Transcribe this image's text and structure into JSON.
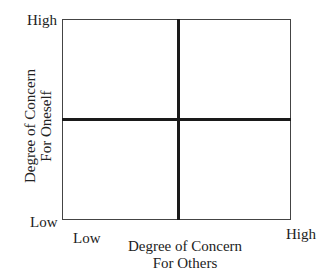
{
  "diagram": {
    "type": "2x2 quadrant grid",
    "y_axis": {
      "title_line1": "Degree of Concern",
      "title_line2": "For Oneself",
      "high_label": "High",
      "low_label": "Low"
    },
    "x_axis": {
      "title_line1": "Degree of Concern",
      "title_line2": "For Others",
      "low_label": "Low",
      "high_label": "High"
    },
    "line_color": "#1a1a1a"
  }
}
